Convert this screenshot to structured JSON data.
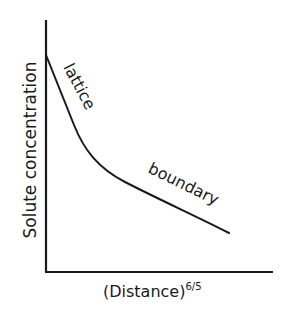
{
  "diagram": {
    "type": "schematic line diagram",
    "y_axis_label": "Solute concentration",
    "x_axis_label_base": "(Distance)",
    "x_axis_label_exponent": "6/5",
    "curve_labels": {
      "upper": "lattice",
      "lower": "boundary"
    },
    "colors": {
      "ink": "#1a1a1a",
      "background": "#ffffff"
    }
  }
}
